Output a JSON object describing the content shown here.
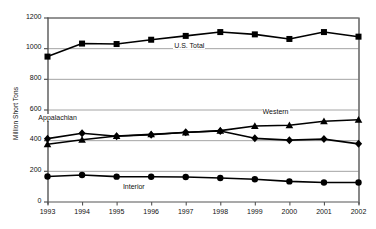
{
  "chart_data": {
    "type": "line",
    "title": "",
    "subtitle": "",
    "xlabel": "",
    "ylabel": "Million Short Tons",
    "x": [
      1993,
      1994,
      1995,
      1996,
      1997,
      1998,
      1999,
      2000,
      2001,
      2002
    ],
    "xtick_labels": [
      "1993",
      "1994",
      "1995",
      "1996",
      "1997",
      "1998",
      "1999",
      "2000",
      "2001",
      "2002"
    ],
    "ytick_labels": [
      "0",
      "200",
      "400",
      "600",
      "800",
      "1000",
      "1200"
    ],
    "yticks": [
      0,
      200,
      400,
      600,
      800,
      1000,
      1200
    ],
    "ylim": [
      0,
      1200
    ],
    "xlim": [
      1993,
      2002
    ],
    "grid": true,
    "grid_axis": "y",
    "legend": "inline-annotations",
    "legend_position": "on-plot",
    "series": [
      {
        "name": "U.S. Total",
        "marker": "square",
        "color": "#000000",
        "values": [
          945,
          1030,
          1027,
          1055,
          1080,
          1105,
          1090,
          1060,
          1105,
          1075
        ]
      },
      {
        "name": "Appalachian",
        "marker": "diamond",
        "color": "#000000",
        "values": [
          410,
          445,
          426,
          435,
          452,
          460,
          412,
          400,
          407,
          376
        ]
      },
      {
        "name": "Western",
        "marker": "triangle",
        "color": "#000000",
        "values": [
          373,
          403,
          427,
          438,
          450,
          462,
          492,
          497,
          523,
          533
        ]
      },
      {
        "name": "Interior",
        "marker": "circle",
        "color": "#000000",
        "values": [
          163,
          173,
          162,
          161,
          160,
          153,
          145,
          131,
          124,
          124
        ]
      }
    ],
    "annotations": [
      {
        "text": "U.S. Total",
        "x": 1997.1,
        "y": 1010
      },
      {
        "text": "Appalachian",
        "x": 1993.3,
        "y": 540
      },
      {
        "text": "Western",
        "x": 1999.6,
        "y": 580
      },
      {
        "text": "Interior",
        "x": 1995.5,
        "y": 90
      }
    ],
    "colors": {
      "axis": "#555555",
      "grid": "#9a9a9a",
      "series": "#000000",
      "background": "#ffffff",
      "text": "#111111"
    }
  }
}
